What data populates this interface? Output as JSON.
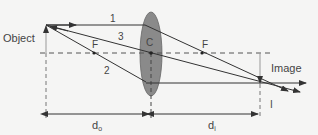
{
  "labels": {
    "object": "Object",
    "image": "Image",
    "ray1": "1",
    "ray2": "2",
    "ray3": "3",
    "center": "C",
    "focus_left": "F",
    "focus_right": "F",
    "image_marker": "I",
    "d_object": "d",
    "d_object_sub": "o",
    "d_image": "d",
    "d_image_sub": "i"
  },
  "colors": {
    "line": "#333333",
    "lens_fill": "#8a8a8a",
    "lens_stroke": "#666666",
    "dash": "#555555",
    "background": "#f5f5f4"
  }
}
